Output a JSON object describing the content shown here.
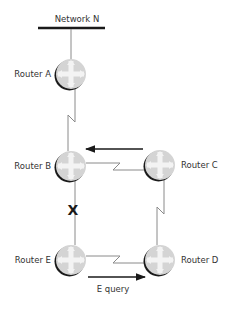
{
  "network": {
    "label": "Network N"
  },
  "routers": {
    "a": {
      "label": "Router A"
    },
    "b": {
      "label": "Router B"
    },
    "c": {
      "label": "Router C"
    },
    "d": {
      "label": "Router D"
    },
    "e": {
      "label": "Router E"
    }
  },
  "annotations": {
    "failure_mark": "X",
    "query_label": "E query"
  },
  "colors": {
    "router_fill": "#d6d6d6",
    "router_cross": "#f2f2f2",
    "router_shadow": "#1a1a1a",
    "bus": "#1a1a1a",
    "link": "#8a8a8a",
    "arrow": "#1a1a1a"
  }
}
